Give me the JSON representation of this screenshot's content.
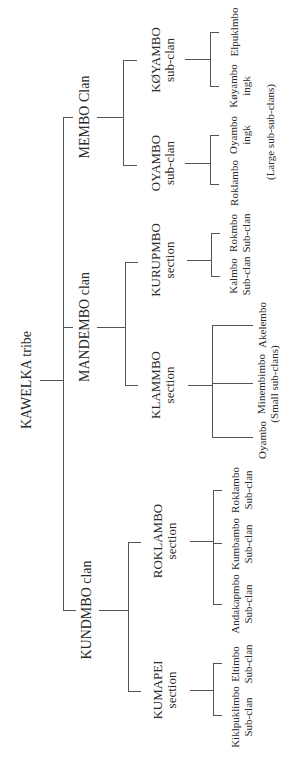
{
  "diagram": {
    "type": "tree",
    "orientation": "rotated -90deg (reads bottom-to-top, root on left)",
    "line_color": "#555555",
    "text_color": "#2a2a2a",
    "root": {
      "label": "KAWELKA tribe",
      "children": [
        {
          "label": "MEMBO Clan",
          "children": [
            {
              "line1": "OYAMBO",
              "line2": "sub-clan",
              "children": [
                {
                  "line1": "Roklambo",
                  "line2": ""
                },
                {
                  "line1": "Oyambo",
                  "line2": "ingk"
                }
              ]
            },
            {
              "line1": "KØYAMBO",
              "line2": "sub-clan",
              "children": [
                {
                  "line1": "Køyambo",
                  "line2": "ingk"
                },
                {
                  "line1": "Elpuklmbo",
                  "line2": ""
                }
              ]
            }
          ],
          "note": "(Large sub-sub-clans)"
        },
        {
          "label": "MANDEMBO clan",
          "children": [
            {
              "line1": "KLAMMBO",
              "line2": "section",
              "children": [
                {
                  "line1": "Oyambo",
                  "line2": ""
                },
                {
                  "line1": "Minembimbo",
                  "line2": "(Small sub-clans)"
                },
                {
                  "line1": "Akelembo",
                  "line2": ""
                }
              ]
            },
            {
              "line1": "KURUPMBO",
              "line2": "section",
              "children": [
                {
                  "line1": "Kalmbo",
                  "line2": "Sub-clan"
                },
                {
                  "line1": "Rokmbo",
                  "line2": "Sub-clan"
                }
              ]
            }
          ]
        },
        {
          "label": "KUNDMBO clan",
          "children": [
            {
              "line1": "KUMAPEI",
              "line2": "section",
              "children": [
                {
                  "line1": "Kiklpuklimbo",
                  "line2": "Sub-clan"
                },
                {
                  "line1": "Eltimbo",
                  "line2": "Sub-clan"
                }
              ]
            },
            {
              "line1": "ROKLAMBO",
              "line2": "section",
              "children": [
                {
                  "line1": "Andakapmbo",
                  "line2": "Sub-clan"
                },
                {
                  "line1": "Kumbambo",
                  "line2": "Sub-clan"
                },
                {
                  "line1": "Roklambo",
                  "line2": "Sub-clan"
                }
              ]
            }
          ]
        }
      ]
    }
  }
}
